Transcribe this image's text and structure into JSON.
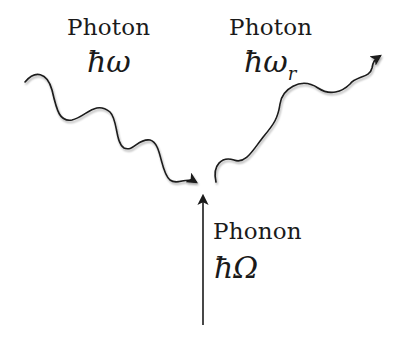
{
  "diagram": {
    "type": "raman-scattering-process",
    "incident_photon": {
      "label": "Photon",
      "energy": "ħω"
    },
    "scattered_photon": {
      "label": "Photon",
      "energy_main": "ħω",
      "energy_sub": "r"
    },
    "phonon": {
      "label": "Phonon",
      "energy": "ħΩ"
    },
    "colors": {
      "line": "#1a1a1a",
      "background": "#ffffff"
    }
  }
}
